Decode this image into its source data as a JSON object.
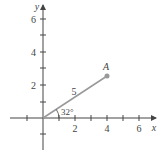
{
  "diagram": {
    "type": "coordinate-plane-vector",
    "axes": {
      "x_label": "x",
      "y_label": "y",
      "x_ticks": [
        {
          "value": -1,
          "label": ""
        },
        {
          "value": 1,
          "label": ""
        },
        {
          "value": 2,
          "label": "2"
        },
        {
          "value": 3,
          "label": ""
        },
        {
          "value": 4,
          "label": "4"
        },
        {
          "value": 5,
          "label": ""
        },
        {
          "value": 6,
          "label": "6"
        }
      ],
      "y_ticks": [
        {
          "value": -1,
          "label": ""
        },
        {
          "value": 1,
          "label": ""
        },
        {
          "value": 2,
          "label": "2"
        },
        {
          "value": 3,
          "label": ""
        },
        {
          "value": 4,
          "label": "4"
        },
        {
          "value": 5,
          "label": ""
        },
        {
          "value": 6,
          "label": "6"
        }
      ]
    },
    "segment": {
      "from": [
        0,
        0
      ],
      "to": [
        4.24,
        2.65
      ],
      "length_label": "5",
      "angle_label": "32°",
      "endpoint_label": "A",
      "color": "#999999"
    },
    "colors": {
      "axis": "#444444",
      "point": "#999999"
    }
  }
}
